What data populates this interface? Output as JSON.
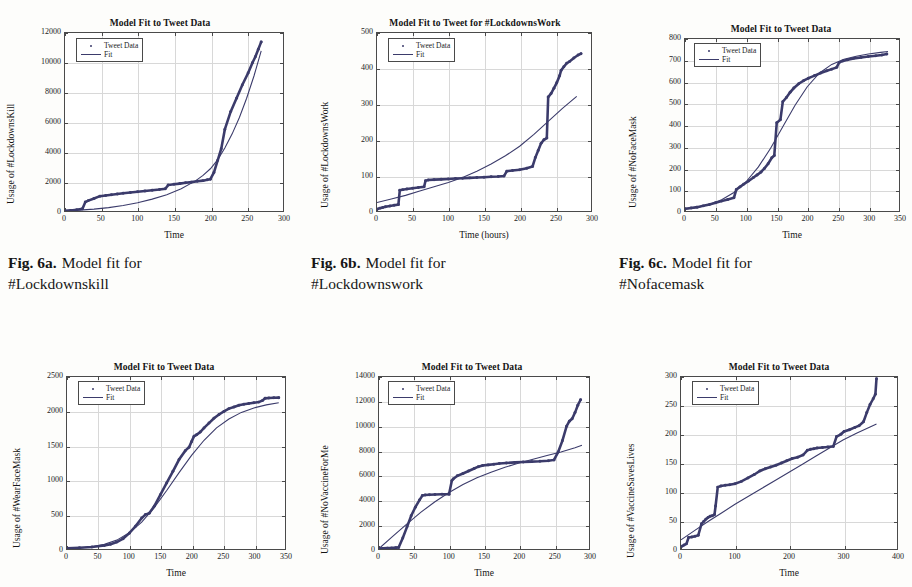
{
  "page": {
    "background": "#fdfdfb",
    "ink": "#1b1b1b",
    "series_color": "#3b3b6b"
  },
  "legend": {
    "data_label": "Tweet Data",
    "fit_label": "Fit"
  },
  "captions": [
    {
      "lead": "Fig. 6a.",
      "text": "Model fit for",
      "subject": "#Lockdownskill"
    },
    {
      "lead": "Fig. 6b.",
      "text": "Model fit for",
      "subject": "#Lockdownswork"
    },
    {
      "lead": "Fig. 6c.",
      "text": "Model fit for",
      "subject": "#Nofacemask"
    }
  ],
  "chart_data": [
    {
      "id": "lockdownskill",
      "type": "scatter",
      "title": "Model Fit to Tweet Data",
      "xlabel": "Time",
      "ylabel": "Usage of #LockdownsKill",
      "xlim": [
        0,
        300
      ],
      "ylim": [
        0,
        12000
      ],
      "xticks": [
        0,
        50,
        100,
        150,
        200,
        250,
        300
      ],
      "yticks": [
        0,
        2000,
        4000,
        6000,
        8000,
        10000,
        12000
      ],
      "grid": true,
      "legend_position": "top-left",
      "series": [
        {
          "name": "Tweet Data",
          "x": [
            0,
            8,
            16,
            24,
            28,
            32,
            40,
            48,
            56,
            64,
            72,
            80,
            90,
            100,
            110,
            120,
            130,
            138,
            142,
            150,
            158,
            166,
            174,
            182,
            190,
            196,
            200,
            205,
            210,
            215,
            220,
            228,
            236,
            244,
            252,
            258,
            262,
            266,
            270
          ],
          "y": [
            10,
            40,
            90,
            150,
            600,
            700,
            850,
            1000,
            1050,
            1100,
            1150,
            1200,
            1250,
            1300,
            1350,
            1400,
            1450,
            1500,
            1750,
            1800,
            1850,
            1900,
            1950,
            2000,
            2050,
            2100,
            2150,
            2600,
            3400,
            4200,
            5500,
            6700,
            7600,
            8500,
            9300,
            10000,
            10400,
            10900,
            11400
          ]
        },
        {
          "name": "Fit",
          "x": [
            0,
            20,
            40,
            60,
            80,
            100,
            120,
            140,
            160,
            180,
            190,
            200,
            210,
            220,
            230,
            240,
            250,
            260,
            270
          ],
          "y": [
            0,
            60,
            130,
            230,
            370,
            560,
            800,
            1100,
            1500,
            2050,
            2400,
            2850,
            3450,
            4250,
            5200,
            6300,
            7600,
            9100,
            10800
          ]
        }
      ]
    },
    {
      "id": "lockdownswork",
      "type": "scatter",
      "title": "Model Fit to Tweet for #LockdownsWork",
      "xlabel": "Time (hours)",
      "ylabel": "Usage of #LockdownsWork",
      "xlim": [
        0,
        300
      ],
      "ylim": [
        0,
        500
      ],
      "xticks": [
        0,
        50,
        100,
        150,
        200,
        250,
        300
      ],
      "yticks": [
        0,
        100,
        200,
        300,
        400,
        500
      ],
      "grid": true,
      "legend_position": "top-left",
      "series": [
        {
          "name": "Tweet Data",
          "x": [
            0,
            4,
            8,
            12,
            18,
            24,
            30,
            32,
            36,
            42,
            50,
            58,
            66,
            68,
            72,
            80,
            90,
            100,
            110,
            120,
            130,
            140,
            150,
            160,
            170,
            178,
            182,
            190,
            200,
            210,
            218,
            222,
            226,
            230,
            234,
            238,
            240,
            244,
            248,
            252,
            256,
            258,
            262,
            266,
            270,
            276,
            282,
            286
          ],
          "y": [
            5,
            8,
            10,
            12,
            14,
            16,
            18,
            58,
            60,
            62,
            64,
            66,
            68,
            85,
            87,
            88,
            89,
            90,
            91,
            92,
            93,
            94,
            95,
            96,
            97,
            98,
            112,
            114,
            116,
            120,
            125,
            150,
            170,
            190,
            200,
            205,
            320,
            330,
            345,
            360,
            380,
            395,
            405,
            415,
            420,
            430,
            438,
            442
          ]
        },
        {
          "name": "Fit",
          "x": [
            0,
            20,
            40,
            60,
            80,
            100,
            120,
            140,
            160,
            180,
            200,
            220,
            240,
            260,
            280
          ],
          "y": [
            24,
            34,
            44,
            56,
            68,
            80,
            94,
            112,
            132,
            155,
            182,
            215,
            252,
            288,
            322
          ]
        }
      ]
    },
    {
      "id": "nofacemask",
      "type": "scatter",
      "title": "Model Fit to Tweet Data",
      "xlabel": "Time",
      "ylabel": "Usage of #NoFaceMask",
      "xlim": [
        0,
        350
      ],
      "ylim": [
        0,
        800
      ],
      "xticks": [
        0,
        50,
        100,
        150,
        200,
        250,
        300,
        350
      ],
      "yticks": [
        0,
        100,
        200,
        300,
        400,
        500,
        600,
        700,
        800
      ],
      "grid": true,
      "legend_position": "top-left",
      "series": [
        {
          "name": "Tweet Data",
          "x": [
            0,
            10,
            20,
            30,
            40,
            50,
            60,
            70,
            80,
            84,
            90,
            96,
            104,
            112,
            118,
            124,
            130,
            136,
            142,
            146,
            150,
            156,
            160,
            166,
            172,
            178,
            186,
            194,
            202,
            212,
            222,
            232,
            240,
            248,
            252,
            258,
            266,
            276,
            288,
            300,
            312,
            322,
            330
          ],
          "y": [
            10,
            14,
            18,
            24,
            30,
            38,
            46,
            54,
            62,
            100,
            112,
            124,
            140,
            156,
            168,
            180,
            198,
            220,
            248,
            258,
            410,
            425,
            508,
            528,
            552,
            572,
            592,
            606,
            618,
            630,
            642,
            652,
            660,
            668,
            690,
            698,
            704,
            710,
            714,
            718,
            722,
            726,
            730
          ]
        },
        {
          "name": "Fit",
          "x": [
            0,
            20,
            40,
            60,
            80,
            100,
            120,
            140,
            160,
            180,
            200,
            220,
            240,
            260,
            280,
            300,
            320,
            332
          ],
          "y": [
            8,
            16,
            30,
            52,
            86,
            136,
            205,
            292,
            392,
            492,
            578,
            642,
            682,
            706,
            720,
            730,
            738,
            742
          ]
        }
      ]
    },
    {
      "id": "wearfacemask",
      "type": "scatter",
      "title": "Model Fit to Tweet Data",
      "xlabel": "Time",
      "ylabel": "Usage of #WearFaceMask",
      "xlim": [
        0,
        350
      ],
      "ylim": [
        0,
        2500
      ],
      "xticks": [
        0,
        50,
        100,
        150,
        200,
        250,
        300,
        350
      ],
      "yticks": [
        0,
        500,
        1000,
        1500,
        2000,
        2500
      ],
      "grid": true,
      "legend_position": "top-left",
      "series": [
        {
          "name": "Tweet Data",
          "x": [
            0,
            20,
            40,
            60,
            70,
            80,
            90,
            100,
            110,
            120,
            126,
            132,
            140,
            150,
            160,
            170,
            180,
            190,
            196,
            200,
            204,
            208,
            214,
            220,
            228,
            236,
            244,
            252,
            260,
            268,
            276,
            284,
            292,
            300,
            308,
            314,
            318,
            324,
            332,
            340
          ],
          "y": [
            10,
            18,
            30,
            50,
            70,
            100,
            150,
            230,
            330,
            450,
            500,
            520,
            620,
            790,
            960,
            1130,
            1300,
            1430,
            1480,
            1560,
            1640,
            1660,
            1700,
            1760,
            1830,
            1900,
            1955,
            2000,
            2040,
            2065,
            2090,
            2105,
            2115,
            2125,
            2135,
            2160,
            2190,
            2195,
            2198,
            2200
          ]
        },
        {
          "name": "Fit",
          "x": [
            0,
            20,
            40,
            60,
            80,
            100,
            120,
            140,
            160,
            180,
            200,
            220,
            240,
            260,
            280,
            300,
            320,
            340
          ],
          "y": [
            5,
            14,
            32,
            68,
            130,
            235,
            390,
            600,
            850,
            1110,
            1360,
            1580,
            1760,
            1890,
            1985,
            2050,
            2095,
            2125
          ]
        }
      ]
    },
    {
      "id": "novaccineforme",
      "type": "scatter",
      "title": "Model Fit to Tweet Data",
      "xlabel": "Time",
      "ylabel": "Usage of #NoVaccineForMe",
      "xlim": [
        0,
        300
      ],
      "ylim": [
        0,
        14000
      ],
      "xticks": [
        0,
        50,
        100,
        150,
        200,
        250,
        300
      ],
      "yticks": [
        0,
        2000,
        4000,
        6000,
        8000,
        10000,
        12000,
        14000
      ],
      "grid": true,
      "legend_position": "top-left",
      "series": [
        {
          "name": "Tweet Data",
          "x": [
            0,
            6,
            12,
            18,
            24,
            28,
            34,
            40,
            46,
            52,
            58,
            62,
            66,
            72,
            80,
            90,
            100,
            104,
            106,
            112,
            120,
            128,
            136,
            142,
            148,
            156,
            164,
            172,
            182,
            194,
            206,
            218,
            230,
            242,
            250,
            256,
            262,
            268,
            272,
            276,
            280,
            284,
            288
          ],
          "y": [
            30,
            50,
            70,
            90,
            110,
            130,
            900,
            1800,
            2700,
            3400,
            4000,
            4350,
            4400,
            4420,
            4440,
            4450,
            4460,
            5550,
            5700,
            5950,
            6150,
            6350,
            6550,
            6700,
            6800,
            6850,
            6900,
            6950,
            7000,
            7050,
            7080,
            7110,
            7140,
            7180,
            7250,
            7900,
            8800,
            10000,
            10400,
            10600,
            11100,
            11700,
            12150
          ]
        },
        {
          "name": "Fit",
          "x": [
            0,
            20,
            40,
            60,
            80,
            100,
            120,
            140,
            160,
            180,
            200,
            220,
            240,
            260,
            280,
            290
          ],
          "y": [
            40,
            1050,
            2050,
            3000,
            3850,
            4600,
            5250,
            5800,
            6250,
            6650,
            7000,
            7300,
            7600,
            7900,
            8250,
            8450
          ]
        }
      ]
    },
    {
      "id": "vaccinesaveslives",
      "type": "scatter",
      "title": "Model Fit to Tweet Data",
      "xlabel": "Time",
      "ylabel": "Usage of #VaccineSavesLives",
      "xlim": [
        0,
        400
      ],
      "ylim": [
        0,
        300
      ],
      "xticks": [
        0,
        100,
        200,
        300,
        400
      ],
      "yticks": [
        0,
        50,
        100,
        150,
        200,
        250,
        300
      ],
      "grid": true,
      "legend_position": "top-left",
      "series": [
        {
          "name": "Tweet Data",
          "x": [
            2,
            6,
            10,
            14,
            20,
            26,
            32,
            38,
            42,
            46,
            50,
            54,
            58,
            62,
            64,
            68,
            74,
            82,
            90,
            100,
            112,
            124,
            136,
            146,
            156,
            166,
            176,
            186,
            196,
            206,
            216,
            226,
            234,
            240,
            246,
            252,
            262,
            272,
            282,
            288,
            296,
            302,
            312,
            322,
            330,
            338,
            344,
            350,
            356,
            360,
            362
          ],
          "y": [
            5,
            7,
            9,
            20,
            21,
            22,
            24,
            44,
            48,
            52,
            55,
            57,
            58,
            60,
            75,
            108,
            110,
            111,
            112,
            114,
            118,
            124,
            130,
            136,
            140,
            143,
            146,
            150,
            154,
            158,
            160,
            164,
            172,
            174,
            175,
            176,
            177,
            178,
            179,
            196,
            200,
            205,
            208,
            212,
            215,
            222,
            238,
            252,
            262,
            270,
            297
          ]
        },
        {
          "name": "Fit",
          "x": [
            0,
            25,
            50,
            75,
            100,
            125,
            150,
            175,
            200,
            225,
            250,
            275,
            300,
            325,
            350,
            362
          ],
          "y": [
            16,
            32,
            48,
            63,
            78,
            92,
            106,
            120,
            134,
            148,
            162,
            176,
            190,
            202,
            213,
            218
          ]
        }
      ]
    }
  ],
  "bleed_text": [
    "Model Fit",
    "Tweet",
    "Fit",
    "Time",
    "Usage"
  ]
}
